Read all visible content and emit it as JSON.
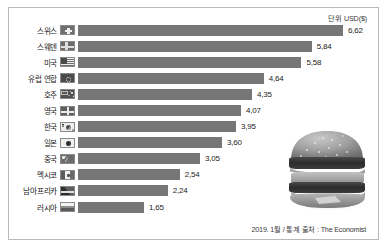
{
  "unit_label": "단위 USD($)",
  "source_note": "2019. 1월 / 통계 출처 : The Economist",
  "burger_image_alt": "big-mac-photo",
  "colors": {
    "bar": "#767676",
    "frame_border": "#b9b9b9",
    "text": "#1a1a1a",
    "background": "#ffffff"
  },
  "chart_data": {
    "type": "bar",
    "orientation": "horizontal",
    "title": "",
    "subtitle": "",
    "xlabel": "",
    "ylabel": "",
    "unit": "단위 USD($)",
    "source": "2019. 1월 / 통계 출처 : The Economist",
    "xlim": [
      0,
      6.62
    ],
    "grid": false,
    "legend": "none",
    "categories": [
      "스위스",
      "스웨덴",
      "미국",
      "유럽 연합",
      "호주",
      "영국",
      "한국",
      "일본",
      "중국",
      "멕시코",
      "남아프리카",
      "러시아"
    ],
    "values": [
      6.62,
      5.84,
      5.58,
      4.64,
      4.35,
      4.07,
      3.95,
      3.6,
      3.05,
      2.54,
      2.24,
      1.65
    ],
    "value_labels": [
      "6,62",
      "5,84",
      "5,58",
      "4,64",
      "4,35",
      "4,07",
      "3,95",
      "3,60",
      "3,05",
      "2,54",
      "2,24",
      "1,65"
    ],
    "flags": [
      "ch",
      "se",
      "us",
      "eu",
      "au",
      "gb",
      "kr",
      "jp",
      "cn",
      "mx",
      "za",
      "ru"
    ]
  }
}
